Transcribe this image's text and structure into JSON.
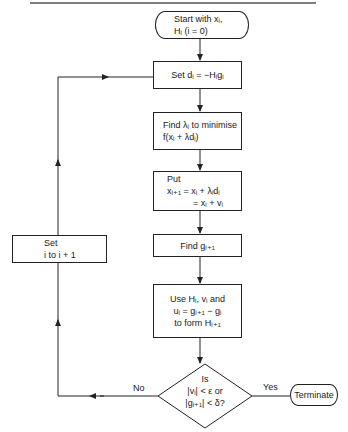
{
  "nodes": {
    "start": {
      "type": "terminal",
      "lines": [
        "Start with xᵢ,",
        "Hᵢ (i = 0)"
      ]
    },
    "set_direction": {
      "type": "process",
      "lines": [
        "Set dᵢ = −Hᵢgᵢ"
      ]
    },
    "line_search": {
      "type": "process",
      "lines": [
        "Find λᵢ to minimise",
        "f(xᵢ + λdᵢ)"
      ]
    },
    "update_x": {
      "type": "process",
      "lines": [
        "Put",
        "xᵢ₊₁ = xᵢ + λᵢdᵢ",
        "= xᵢ + vᵢ"
      ]
    },
    "find_gradient": {
      "type": "process",
      "lines": [
        "Find gᵢ₊₁"
      ]
    },
    "update_h": {
      "type": "process",
      "lines": [
        "Use Hᵢ, vᵢ and",
        "uᵢ = gᵢ₊₁ − gᵢ",
        "to form Hᵢ₊₁"
      ]
    },
    "decision": {
      "type": "decision",
      "lines": [
        "Is",
        "|vᵢ| < ε or",
        "|gᵢ₊₁| < δ?"
      ]
    },
    "terminate": {
      "type": "terminal",
      "lines": [
        "Terminate"
      ]
    },
    "increment": {
      "type": "process",
      "lines": [
        "Set",
        "i to i + 1"
      ]
    }
  },
  "edges": [
    {
      "from": "start",
      "to": "set_direction",
      "label": ""
    },
    {
      "from": "set_direction",
      "to": "line_search",
      "label": ""
    },
    {
      "from": "line_search",
      "to": "update_x",
      "label": ""
    },
    {
      "from": "update_x",
      "to": "find_gradient",
      "label": ""
    },
    {
      "from": "find_gradient",
      "to": "update_h",
      "label": ""
    },
    {
      "from": "update_h",
      "to": "decision",
      "label": ""
    },
    {
      "from": "decision",
      "to": "terminate",
      "label": "Yes"
    },
    {
      "from": "decision",
      "to": "increment",
      "label": "No"
    },
    {
      "from": "increment",
      "to": "set_direction",
      "label": ""
    }
  ],
  "labels": {
    "yes": "Yes",
    "no": "No"
  },
  "colors": {
    "stroke": "#222222",
    "background": "#ffffff",
    "text": "#1a1a1a"
  }
}
